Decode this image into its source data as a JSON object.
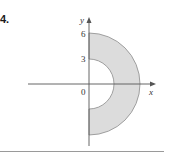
{
  "problem": {
    "number": "4."
  },
  "figure": {
    "axes": {
      "x_label": "x",
      "y_label": "y",
      "origin_label": "0"
    },
    "ticks": {
      "y": [
        "3",
        "6"
      ]
    },
    "region": {
      "shape": "right half annulus",
      "inner_radius": 3,
      "outer_radius": 6,
      "fill_color": "#dcdcdc",
      "stroke_color": "#8c8c8c"
    },
    "colors": {
      "axis": "#555555",
      "text": "#333333"
    }
  }
}
